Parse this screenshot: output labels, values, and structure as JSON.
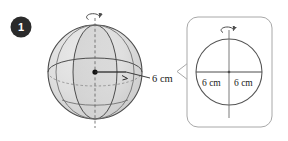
{
  "figure": {
    "number_badge": "1",
    "type": "geometry-diagram"
  },
  "sphere": {
    "radius_label": "6 cm",
    "axis_icon": "rotation-arrow-icon",
    "center_icon": "center-point-dot",
    "radius_arrow_icon": "radius-arrow-icon",
    "fill_color": "#dcdcdc",
    "shade_color": "#cfcfcf",
    "outline_color": "#4d4d4d",
    "hidden_line_color": "#8c8c8c"
  },
  "callout": {
    "left_label": "6 cm",
    "right_label": "6 cm",
    "axis_icon": "rotation-arrow-icon",
    "border_color": "#a8a8a8",
    "fill_color": "#ffffff",
    "circle_outline_color": "#555555",
    "pointer_icon": "callout-tail-icon"
  },
  "colors": {
    "badge_fill": "#2b2b2b",
    "badge_text": "#ffffff",
    "background": "#ffffff"
  }
}
